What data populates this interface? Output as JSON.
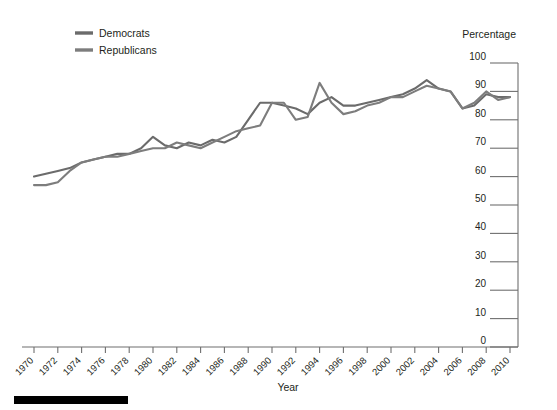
{
  "chart_data": {
    "type": "line",
    "title": "",
    "xlabel": "Year",
    "ylabel": "Percentage",
    "ylim": [
      0,
      100
    ],
    "xlim": [
      1970,
      2010
    ],
    "ytick_step": 10,
    "xtick_step": 2,
    "grid": false,
    "legend_position": "top-left",
    "ylabel_position": "top-right",
    "yticks": [
      100,
      90,
      80,
      70,
      60,
      50,
      40,
      30,
      20,
      10,
      0
    ],
    "xticks": [
      1970,
      1972,
      1974,
      1976,
      1978,
      1980,
      1982,
      1984,
      1986,
      1988,
      1990,
      1992,
      1994,
      1996,
      1998,
      2000,
      2002,
      2004,
      2006,
      2008,
      2010
    ],
    "x": [
      1970,
      1971,
      1972,
      1973,
      1974,
      1975,
      1976,
      1977,
      1978,
      1979,
      1980,
      1981,
      1982,
      1983,
      1984,
      1985,
      1986,
      1987,
      1988,
      1989,
      1990,
      1991,
      1992,
      1993,
      1994,
      1995,
      1996,
      1997,
      1998,
      1999,
      2000,
      2001,
      2002,
      2003,
      2004,
      2005,
      2006,
      2007,
      2008,
      2009,
      2010
    ],
    "series": [
      {
        "name": "Democrats",
        "color": "#6b6b6b",
        "values": [
          60,
          61,
          62,
          63,
          65,
          66,
          67,
          68,
          68,
          70,
          74,
          71,
          70,
          72,
          71,
          73,
          72,
          74,
          80,
          86,
          86,
          85,
          84,
          82,
          86,
          88,
          85,
          85,
          86,
          87,
          88,
          89,
          91,
          94,
          91,
          90,
          84,
          85,
          89,
          88,
          88
        ]
      },
      {
        "name": "Republicans",
        "color": "#7d7d7d",
        "values": [
          57,
          57,
          58,
          62,
          65,
          66,
          67,
          67,
          68,
          69,
          70,
          70,
          72,
          71,
          70,
          72,
          74,
          76,
          77,
          78,
          86,
          86,
          80,
          81,
          93,
          86,
          82,
          83,
          85,
          86,
          88,
          88,
          90,
          92,
          91,
          90,
          84,
          86,
          90,
          87,
          88
        ]
      }
    ]
  },
  "legend": {
    "items": [
      {
        "label": "Democrats",
        "color": "#6b6b6b"
      },
      {
        "label": "Republicans",
        "color": "#7d7d7d"
      }
    ]
  },
  "axes": {
    "y_title": "Percentage",
    "x_title": "Year"
  },
  "colors": {
    "axis": "#6f6f6f",
    "text": "#231f20",
    "footer_bar": "#000000",
    "background": "#ffffff"
  }
}
